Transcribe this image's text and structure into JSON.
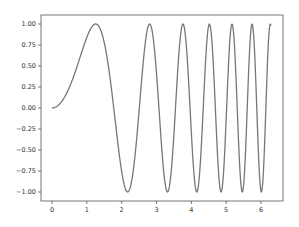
{
  "chart_data": {
    "type": "line",
    "title": "",
    "xlabel": "",
    "ylabel": "",
    "function": "y = sin(x^2)",
    "xlim": [
      -0.31,
      6.6
    ],
    "ylim": [
      -1.1,
      1.1
    ],
    "grid": false,
    "legend": null,
    "x_ticks": [
      0,
      1,
      2,
      3,
      4,
      5,
      6
    ],
    "x_tick_labels": [
      "0",
      "1",
      "2",
      "3",
      "4",
      "5",
      "6"
    ],
    "y_ticks": [
      1.0,
      0.75,
      0.5,
      0.25,
      0.0,
      -0.25,
      -0.5,
      -0.75,
      -1.0
    ],
    "y_tick_labels": [
      "1.00",
      "0.75",
      "0.50",
      "0.25",
      "0.00",
      "−0.25",
      "−0.50",
      "−0.75",
      "−1.00"
    ],
    "series": [
      {
        "name": "sin(x^2)",
        "color": "#777777",
        "x_range": [
          0,
          6.283
        ],
        "samples": 600
      }
    ]
  }
}
